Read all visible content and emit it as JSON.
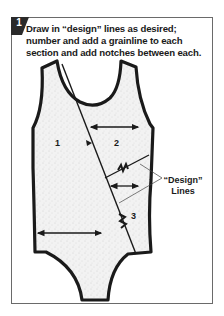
{
  "step": {
    "number": "1",
    "instruction": "Draw in “design” lines as desired; number and add a grainline to each section and add notches between each."
  },
  "diagram": {
    "section_labels": [
      "1",
      "2",
      "3"
    ],
    "callout": {
      "line1": "“Design”",
      "line2": "Lines"
    },
    "colors": {
      "outline": "#1a1a1a",
      "fill": "#efefef",
      "badge": "#2a2a2a",
      "frame": "#6a6a6a"
    }
  }
}
